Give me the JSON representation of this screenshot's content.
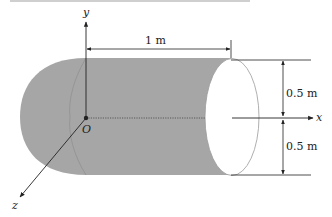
{
  "figure": {
    "colors": {
      "body_fill": "#a6a6a6",
      "end_face": "#ffffff",
      "line": "#222222",
      "hidden_line": "#8a8a8a"
    },
    "axes": {
      "x_label": "x",
      "y_label": "y",
      "z_label": "z",
      "origin_label": "O"
    },
    "dimensions": {
      "length_label": "1 m",
      "upper_radius_label": "0.5 m",
      "lower_radius_label": "0.5 m"
    }
  }
}
